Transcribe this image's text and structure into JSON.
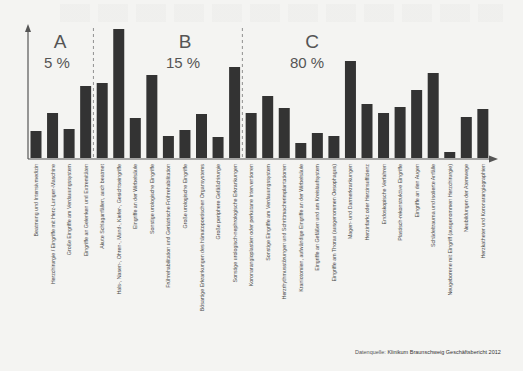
{
  "chart_data": {
    "type": "bar",
    "title": "",
    "xlabel": "",
    "ylabel": "",
    "grid": false,
    "legend": null,
    "y_axis_ticks": false,
    "baseline_px": 158,
    "scale_px_per_unit": 1,
    "groups": [
      {
        "letter": "A",
        "share": "5 %",
        "start_index": 0,
        "end_index": 3
      },
      {
        "letter": "B",
        "share": "15 %",
        "start_index": 4,
        "end_index": 12
      },
      {
        "letter": "C",
        "share": "80 %",
        "start_index": 13,
        "end_index": 27
      }
    ],
    "categories": [
      "Beatmung und Intensivmedizin",
      "Herzchirurgie / Eingriffe mit Herz-Lungen-Maschine",
      "Große Eingriffe am Verdauungssystem",
      "Eingriffe an Gelenken und Extremitäten",
      "Akute Schlaganfällen, auch beatmet",
      "Hals-, Nasen-, Ohren-, Mund-, Kiefer-, Gesichtseingriffe",
      "Eingriffe an der Wirbelsäule",
      "Sonstige urologische Eingriffe",
      "Frührehabilitation und Geriatrische Frührehabilitation",
      "Große urologische Eingriffe",
      "Bösartige Erkrankungen des hämatopoetischen Organsystems",
      "Große periphere Gefäßchirurgie",
      "Sonstige urologisch-nephrologische Erkrankungen",
      "Koronarangioplastien oder perkutane Interventionen",
      "Sonstige Eingriffe am Verdauungssystem",
      "Herzrhythmusstörungen und Schrittmacherimplantationen",
      "Kraniotomien, aufwändige Eingriffe an der Wirbelsäule",
      "Eingriffe an Gefäßen und am Kreislaufsystem",
      "Eingriffe am Thorax (ausgenommen Oesophagus)",
      "Magen- und Darmerkrankungen",
      "Herzinfarkt oder Herzinsuffizienz",
      "Endoskopische Verfahren",
      "Plastisch-rekonstruktive Eingriffe",
      "Eingriffe an den Augen",
      "Schädeltrauma und isolierte Anfälle",
      "Neugeborene mit Eingriff (ausgenommen Herzchirurgie)",
      "Neubildungen der Atemwege",
      "Herzkatheter und Koronarangiographien"
    ],
    "values": [
      27,
      45,
      29,
      72,
      75,
      129,
      40,
      83,
      22,
      28,
      44,
      21,
      91,
      45,
      62,
      50,
      15,
      25,
      22,
      97,
      54,
      45,
      51,
      68,
      85,
      6,
      41,
      49
    ],
    "value_unit": "relative bar height (unlabeled axis, px estimate)"
  },
  "source": {
    "prefix": "Datenquelle: ",
    "text": "Klinikum Braunschweig Geschäftsbericht 2012"
  }
}
